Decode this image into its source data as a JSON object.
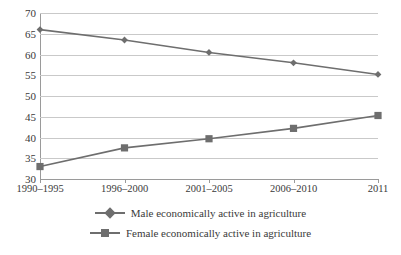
{
  "chart_data": {
    "type": "line",
    "title": "",
    "subtitle": "",
    "xlabel": "",
    "ylabel": "",
    "categories": [
      "1990–1995",
      "1996–2000",
      "2001–2005",
      "2006–2010",
      "2011"
    ],
    "series": [
      {
        "name": "Male economically active in agriculture",
        "values": [
          66.0,
          63.5,
          60.5,
          58.0,
          55.2
        ],
        "marker": "diamond",
        "color": "#6e6e6e"
      },
      {
        "name": "Female economically active in agriculture",
        "values": [
          33.0,
          37.5,
          39.7,
          42.2,
          45.3
        ],
        "marker": "square",
        "color": "#6e6e6e"
      }
    ],
    "ylim": [
      30,
      70
    ],
    "ytick_step": 5,
    "yticks": [
      70,
      65,
      60,
      55,
      50,
      45,
      40,
      35,
      30
    ],
    "grid": true,
    "grid_axis": "y",
    "legend_position": "bottom",
    "colors": {
      "series_line": "#6e6e6e",
      "gridline": "#c9c9c9",
      "axis": "#9a9a9a",
      "text": "#3a3a3a",
      "background": "#ffffff"
    }
  },
  "legend": {
    "items": [
      {
        "label": "Male economically active in agriculture",
        "marker": "diamond-marker-icon"
      },
      {
        "label": "Female economically active in agriculture",
        "marker": "square-marker-icon"
      }
    ]
  }
}
